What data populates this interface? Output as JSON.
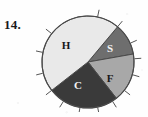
{
  "item": {
    "number": "14."
  },
  "chart_data": {
    "type": "pie",
    "title": "",
    "subtitle": "",
    "xlabel": "",
    "ylabel": "",
    "legend_position": "none",
    "grid": false,
    "labels_inside_slices": true,
    "start_angle_deg": -50,
    "direction": "clockwise",
    "categories": [
      "S",
      "F",
      "C",
      "H"
    ],
    "values": [
      11,
      17,
      25,
      47
    ],
    "units": "percent",
    "slices": [
      {
        "label": "S",
        "value": 11,
        "start_deg": -50,
        "end_deg": -10,
        "color": "#6e6e6e",
        "label_color": "#f2f2f2",
        "label_x": 74,
        "label_y": 41
      },
      {
        "label": "F",
        "value": 17,
        "start_deg": -10,
        "end_deg": 52,
        "color": "#a8a8a8",
        "label_color": "#181818",
        "label_x": 74,
        "label_y": 71
      },
      {
        "label": "C",
        "value": 25,
        "start_deg": 52,
        "end_deg": 142,
        "color": "#3a3a3a",
        "label_color": "#f2f2f2",
        "label_x": 42,
        "label_y": 78
      },
      {
        "label": "H",
        "value": 47,
        "start_deg": 142,
        "end_deg": 310,
        "color": "#e9e9e9",
        "label_color": "#181818",
        "label_x": 30,
        "label_y": 38
      }
    ],
    "tick_marks": {
      "count": 14,
      "color": "#555555",
      "angles_deg": [
        -78,
        -50,
        -24,
        -4,
        16,
        38,
        58,
        78,
        100,
        122,
        142,
        166,
        192,
        218
      ],
      "note": "short radial strokes outside the circle rim"
    },
    "outline_color": "#4a4a4a",
    "center": {
      "x": 52,
      "y": 54
    },
    "radius": 46
  }
}
